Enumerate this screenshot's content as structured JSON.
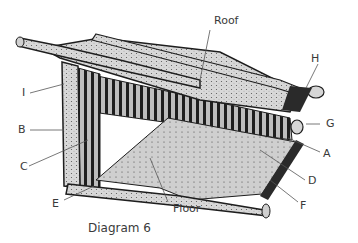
{
  "diagram": {
    "caption": "Diagram 6",
    "labels": {
      "roof": "Roof",
      "floor": "Floor",
      "a": "A",
      "b": "B",
      "c": "C",
      "d": "D",
      "e": "E",
      "f": "F",
      "g": "G",
      "h": "H",
      "i": "I"
    },
    "colors": {
      "ink": "#1e1e1e",
      "fill_light": "#d6d6d6",
      "fill_mid": "#a8a8a8",
      "leader": "#555555"
    }
  }
}
